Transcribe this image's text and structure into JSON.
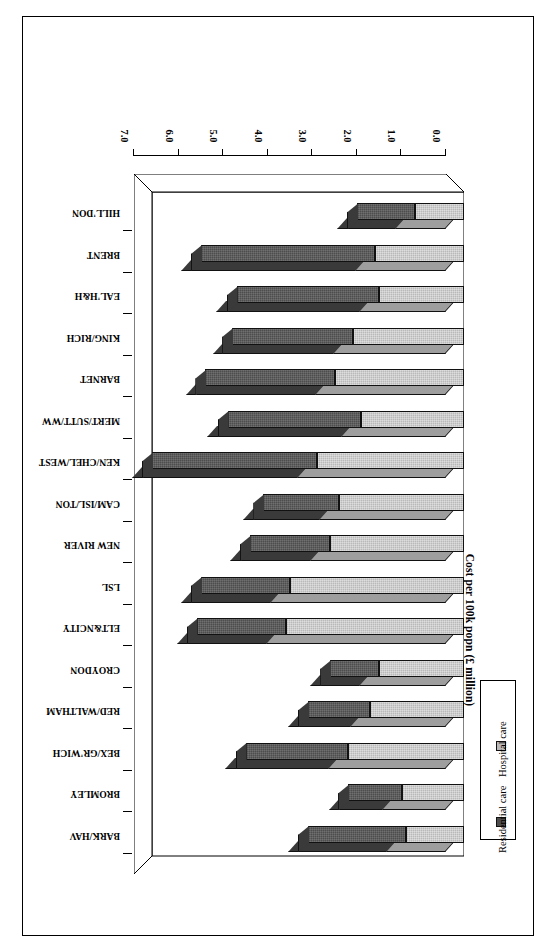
{
  "chart_data": {
    "type": "bar",
    "orientation": "horizontal",
    "stacked": true,
    "threeD": true,
    "title": "",
    "xlabel": "",
    "ylabel": "Cost per 100k popn (£ million)",
    "ylim": [
      0.0,
      7.0
    ],
    "tick_labels": [
      "0.0",
      "1.0",
      "2.0",
      "3.0",
      "4.0",
      "5.0",
      "6.0",
      "7.0"
    ],
    "tick_values": [
      0.0,
      1.0,
      2.0,
      3.0,
      4.0,
      5.0,
      6.0,
      7.0
    ],
    "grid": false,
    "legend_position": "upper-left-inside",
    "categories": [
      "HILL'DON",
      "BRENT",
      "EAL'H&H",
      "KING/RICH",
      "BARNET",
      "MERT/SUTT/WW",
      "KEN/CHEL/WEST",
      "CAM/ISL/TON",
      "NEW RIVER",
      "LSL",
      "ELT&NCITY",
      "CROYDON",
      "RED/WALTHAM",
      "BEX/GR'WICH",
      "BROMLEY",
      "BARK/HAV"
    ],
    "series": [
      {
        "name": "Hospital care",
        "color": "#b9b9b9",
        "values": [
          1.1,
          2.0,
          1.9,
          2.5,
          2.9,
          2.3,
          3.3,
          2.8,
          3.0,
          3.9,
          4.0,
          1.9,
          2.1,
          2.6,
          1.4,
          1.3
        ]
      },
      {
        "name": "Residential care",
        "color": "#4d4d4d",
        "values": [
          1.3,
          3.9,
          3.2,
          2.7,
          2.9,
          3.0,
          3.7,
          1.7,
          1.8,
          2.0,
          2.0,
          1.1,
          1.4,
          2.3,
          1.2,
          2.2
        ]
      }
    ],
    "totals": [
      2.4,
      5.9,
      5.1,
      5.2,
      5.8,
      5.3,
      7.0,
      4.5,
      4.8,
      5.9,
      6.0,
      3.0,
      3.5,
      4.9,
      2.6,
      3.5
    ]
  },
  "legend": {
    "entries": [
      {
        "label": "Residential care",
        "swatch": "#4d4d4d"
      },
      {
        "label": "Hospital care",
        "swatch": "#b9b9b9"
      }
    ]
  },
  "axis": {
    "value_axis_title": "Cost per 100k popn (£ million)",
    "ticks": [
      "7.0",
      "6.0",
      "5.0",
      "4.0",
      "3.0",
      "2.0",
      "1.0",
      "0.0"
    ]
  }
}
